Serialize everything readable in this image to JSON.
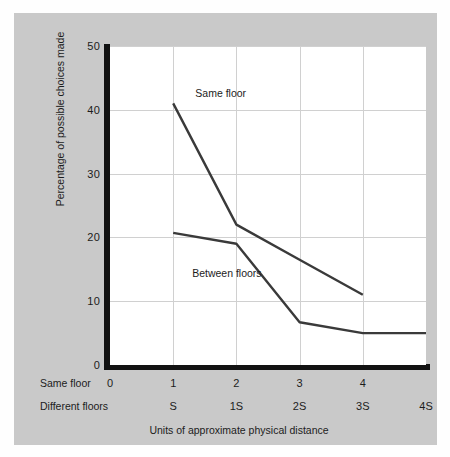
{
  "figure": {
    "background_color": "#fefefe",
    "panel_color": "#c9c9c9",
    "plot_color": "#ffffff",
    "axis_color": "#121212",
    "grid_color": "#d0d0d0",
    "series_color": "#3a3a3a"
  },
  "chart_data": {
    "type": "line",
    "title": "",
    "xlabel": "Units of approximate physical distance",
    "ylabel": "Percentage of possible choices made",
    "xlim": [
      0,
      5
    ],
    "ylim": [
      0,
      50
    ],
    "grid": true,
    "legend_position": "in-plot annotations",
    "y_ticks": [
      50,
      40,
      30,
      20,
      10,
      0
    ],
    "x_tick_rows": [
      {
        "row_label": "Same floor",
        "ticks": [
          "0",
          "1",
          "2",
          "3",
          "4"
        ],
        "x_values": [
          0,
          1,
          2,
          3,
          4
        ]
      },
      {
        "row_label": "Different floors",
        "ticks": [
          "S",
          "1S",
          "2S",
          "3S",
          "4S"
        ],
        "x_values": [
          1,
          2,
          3,
          4,
          5
        ]
      }
    ],
    "x": [
      1,
      2,
      3,
      4,
      5
    ],
    "series": [
      {
        "name": "Same floor",
        "x": [
          1,
          2,
          3,
          4
        ],
        "values": [
          41,
          22,
          16.5,
          11
        ],
        "annotation": "Same floor"
      },
      {
        "name": "Between floors",
        "x": [
          1,
          2,
          3,
          4,
          5
        ],
        "values": [
          20.7,
          19,
          6.7,
          5,
          5
        ],
        "annotation": "Between floors"
      }
    ],
    "annotations": [
      {
        "text": "Same floor",
        "x": 1.35,
        "y": 43.5
      },
      {
        "text": "Between floors",
        "x": 1.3,
        "y": 15.3
      }
    ]
  }
}
